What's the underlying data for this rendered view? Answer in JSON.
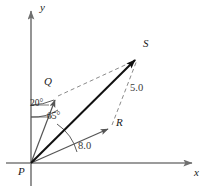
{
  "figure": {
    "kind": "vector-parallelogram-diagram",
    "axes": {
      "x_label": "x",
      "y_label": "y",
      "origin_label": "P"
    },
    "points": {
      "P": {
        "label": "P",
        "x": 31,
        "y": 163
      },
      "Q": {
        "label": "Q",
        "x": 56,
        "y": 98
      },
      "R": {
        "label": "R",
        "x": 110,
        "y": 127
      },
      "S": {
        "label": "S",
        "x": 138,
        "y": 57
      }
    },
    "vectors": [
      {
        "name": "PQ",
        "from": "P",
        "to": "Q",
        "style": "solid-thin",
        "color": "#555555"
      },
      {
        "name": "PR",
        "from": "P",
        "to": "R",
        "style": "solid-thin",
        "color": "#555555"
      },
      {
        "name": "PS",
        "from": "P",
        "to": "S",
        "style": "solid-thick",
        "color": "#111111"
      }
    ],
    "construction_lines": [
      {
        "name": "QS",
        "from": "Q",
        "to": "S",
        "style": "dashed",
        "color": "#8a8a8a"
      },
      {
        "name": "RS",
        "from": "R",
        "to": "S",
        "style": "dashed",
        "color": "#8a8a8a"
      }
    ],
    "angles": [
      {
        "name": "angle-20",
        "label": "20°",
        "value": 20,
        "between": [
          "PS",
          "PQ"
        ]
      },
      {
        "name": "angle-65",
        "label": "65°",
        "value": 65,
        "between": [
          "x-axis",
          "PS"
        ]
      }
    ],
    "magnitudes": [
      {
        "name": "length-5",
        "label": "5.0",
        "value": 5.0,
        "side": "RS"
      },
      {
        "name": "length-8",
        "label": "8.0",
        "value": 8.0,
        "side": "PR"
      }
    ],
    "colors": {
      "axis": "#7a7a7a",
      "vector_thin": "#555555",
      "vector_thick": "#111111",
      "dashed": "#8a8a8a",
      "arc": "#4a4a4a",
      "text": "#1a1a1a",
      "background": "#ffffff"
    }
  }
}
